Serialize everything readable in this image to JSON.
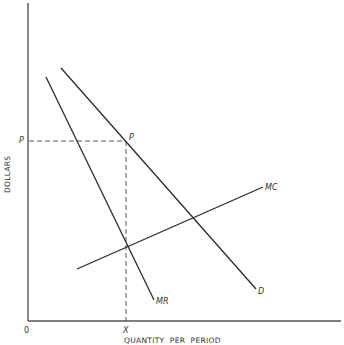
{
  "diagram": {
    "type": "monopoly-pricing",
    "colors": {
      "line": "#2a2a2a",
      "axis": "#555555",
      "text": "#333333",
      "background": "#ffffff"
    },
    "axes": {
      "x_title": "QUANTITY  PER  PERIOD",
      "y_title": "DOLLARS",
      "origin_label": "0",
      "x_tick_label": "X",
      "y_tick_label": "P"
    },
    "curves": [
      {
        "id": "D",
        "label": "D",
        "x1": 61,
        "y1": 68,
        "x2": 256,
        "y2": 289
      },
      {
        "id": "MR",
        "label": "MR",
        "x1": 46,
        "y1": 77,
        "x2": 154,
        "y2": 300
      },
      {
        "id": "MC",
        "label": "MC",
        "x1": 77,
        "y1": 269,
        "x2": 263,
        "y2": 187
      }
    ],
    "points": [
      {
        "id": "P",
        "label": "P",
        "x": 126,
        "y": 141,
        "description": "Price point on demand curve at quantity X"
      },
      {
        "id": "MR=MC",
        "label": "",
        "x": 127,
        "y": 246,
        "description": "Intersection of MR and MC"
      }
    ],
    "guides": {
      "price_line": {
        "from": "y-axis at P",
        "to": "point P"
      },
      "quantity_line": {
        "from": "point P",
        "to": "x-axis at X"
      }
    }
  }
}
